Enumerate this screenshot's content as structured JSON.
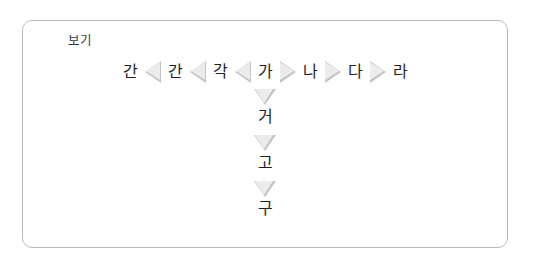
{
  "box": {
    "legend_label": "보기"
  },
  "diagram": {
    "type": "syllable-sequence",
    "colors": {
      "border": "#b9b9b9",
      "triangle_fill": "#ececec",
      "triangle_stroke": "#c4c4c4",
      "text": "#1f1f1f"
    },
    "horizontal_row": [
      {
        "kind": "syllable",
        "text": "간"
      },
      {
        "kind": "arrow",
        "direction": "left",
        "icon": "triangle-left-icon"
      },
      {
        "kind": "syllable",
        "text": "간"
      },
      {
        "kind": "arrow",
        "direction": "left",
        "icon": "triangle-left-icon"
      },
      {
        "kind": "syllable",
        "text": "각"
      },
      {
        "kind": "arrow",
        "direction": "left",
        "icon": "triangle-left-icon"
      },
      {
        "kind": "syllable",
        "text": "가"
      },
      {
        "kind": "arrow",
        "direction": "right",
        "icon": "triangle-right-icon"
      },
      {
        "kind": "syllable",
        "text": "나"
      },
      {
        "kind": "arrow",
        "direction": "right",
        "icon": "triangle-right-icon"
      },
      {
        "kind": "syllable",
        "text": "다"
      },
      {
        "kind": "arrow",
        "direction": "right",
        "icon": "triangle-right-icon"
      },
      {
        "kind": "syllable",
        "text": "라"
      }
    ],
    "vertical_column": [
      {
        "kind": "arrow",
        "direction": "down",
        "icon": "triangle-down-icon"
      },
      {
        "kind": "syllable",
        "text": "거"
      },
      {
        "kind": "arrow",
        "direction": "down",
        "icon": "triangle-down-icon"
      },
      {
        "kind": "syllable",
        "text": "고"
      },
      {
        "kind": "arrow",
        "direction": "down",
        "icon": "triangle-down-icon"
      },
      {
        "kind": "syllable",
        "text": "구"
      }
    ]
  }
}
